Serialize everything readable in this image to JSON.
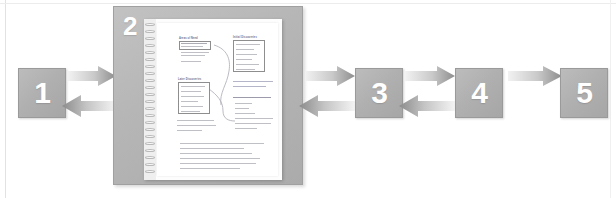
{
  "diagram": {
    "type": "five-step-process-with-expanded-detail",
    "title": "",
    "steps": [
      {
        "number": "1",
        "label": "1"
      },
      {
        "number": "2",
        "label": "2"
      },
      {
        "number": "3",
        "label": "3"
      },
      {
        "number": "4",
        "label": "4"
      },
      {
        "number": "5",
        "label": "5"
      }
    ],
    "connectors": [
      {
        "id": "c1-2-forward",
        "from": "1",
        "to": "2",
        "direction": "right"
      },
      {
        "id": "c2-1-backward",
        "from": "2",
        "to": "1",
        "direction": "left"
      },
      {
        "id": "c2-3-forward",
        "from": "2",
        "to": "3",
        "direction": "right"
      },
      {
        "id": "c3-2-backward",
        "from": "3",
        "to": "2",
        "direction": "left"
      },
      {
        "id": "c3-4-forward",
        "from": "3",
        "to": "4",
        "direction": "right"
      },
      {
        "id": "c4-3-backward",
        "from": "4",
        "to": "3",
        "direction": "left"
      },
      {
        "id": "c4-5-forward",
        "from": "4",
        "to": "5",
        "direction": "right"
      }
    ]
  },
  "panel": {
    "step_number": "2",
    "content_type": "photograph",
    "subject": "spiral-bound notebook page with handwritten notes",
    "notebook": {
      "binding": "spiral",
      "note_boxes": [
        {
          "id": "box-top-left",
          "title": "Areas of Need"
        },
        {
          "id": "box-top-right",
          "title": "Initial Discoveries"
        },
        {
          "id": "box-middle-left",
          "title": "Later Discoveries"
        }
      ],
      "text_blocks": [
        {
          "id": "paragraph-right-upper",
          "lines": 2
        },
        {
          "id": "list-right-lower",
          "title": "Key Things I Know or Realize",
          "lines": 5
        },
        {
          "id": "paragraph-left-lower",
          "lines": 3
        },
        {
          "id": "question-list-bottom",
          "lines": 6
        }
      ]
    }
  },
  "colors": {
    "box_fill": "#b0b0b0",
    "box_border": "#9a9a9a",
    "box_number": "#ffffff",
    "panel_fill": "#b6b6b6",
    "panel_border": "#a0a0a0",
    "arrow_light": "#e6e6e6",
    "arrow_dark": "#8f8f8f",
    "page_white": "#ffffff",
    "background": "#ffffff"
  }
}
